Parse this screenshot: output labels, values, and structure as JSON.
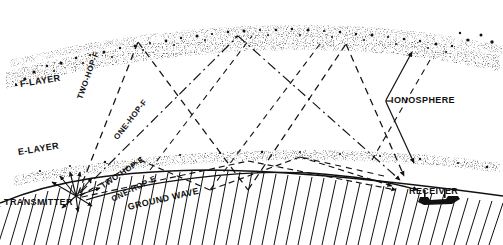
{
  "colors": {
    "ink": "#111111",
    "stipple": "#1a1a1a",
    "background": "#ffffff"
  },
  "layers": {
    "f_layer": {
      "label": "F-LAYER"
    },
    "e_layer": {
      "label": "E-LAYER"
    },
    "ionosphere": {
      "label": "IONOSPHERE"
    }
  },
  "endpoints": {
    "transmitter": {
      "label": "TRANSMITTER"
    },
    "receiver": {
      "label": "RECEIVER"
    }
  },
  "paths": [
    {
      "label": "TWO-HOP-F",
      "style": "dashed"
    },
    {
      "label": "ONE-HOP-F",
      "style": "dash-dot"
    },
    {
      "label": "TWO-HOP-E",
      "style": "dashed"
    },
    {
      "label": "ONE-HOP-E",
      "style": "dashed"
    },
    {
      "label": "GROUND WAVE",
      "style": "solid"
    }
  ],
  "icons": {
    "ionosphere_bracket": "bracket-pointer-icon",
    "receiver_building": "receiver-building-icon",
    "transmitter_burst": "transmitter-radiation-icon",
    "earth_surface": "earth-curve-hatch-icon"
  }
}
